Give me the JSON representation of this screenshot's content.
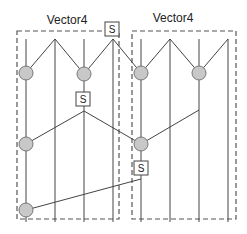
{
  "diagram": {
    "title_left": "Vector4",
    "title_right": "Vector4",
    "shuffle_label": "S",
    "colors": {
      "line": "#444444",
      "dash": "#555555",
      "node_fill": "#c8c8c8",
      "node_stroke": "#777777",
      "box_fill": "#ffffff"
    },
    "groups": [
      {
        "label": "Vector4",
        "x": 17,
        "y": 31,
        "w": 102,
        "h": 188,
        "lanes_x": [
          26,
          55,
          84,
          113
        ]
      },
      {
        "label": "Vector4",
        "x": 132,
        "y": 31,
        "w": 104,
        "h": 188,
        "lanes_x": [
          141,
          170,
          199,
          228
        ]
      }
    ],
    "nodes": [
      {
        "id": "n1",
        "x": 26,
        "y": 73
      },
      {
        "id": "n2",
        "x": 84,
        "y": 74
      },
      {
        "id": "n3",
        "x": 141,
        "y": 73
      },
      {
        "id": "n4",
        "x": 199,
        "y": 73
      },
      {
        "id": "n5",
        "x": 26,
        "y": 144
      },
      {
        "id": "n6",
        "x": 141,
        "y": 144
      },
      {
        "id": "n7",
        "x": 26,
        "y": 210
      }
    ],
    "shuffles": [
      {
        "label": "S",
        "x": 112,
        "y": 29
      },
      {
        "label": "S",
        "x": 83,
        "y": 99
      },
      {
        "label": "S",
        "x": 141,
        "y": 168
      }
    ]
  }
}
